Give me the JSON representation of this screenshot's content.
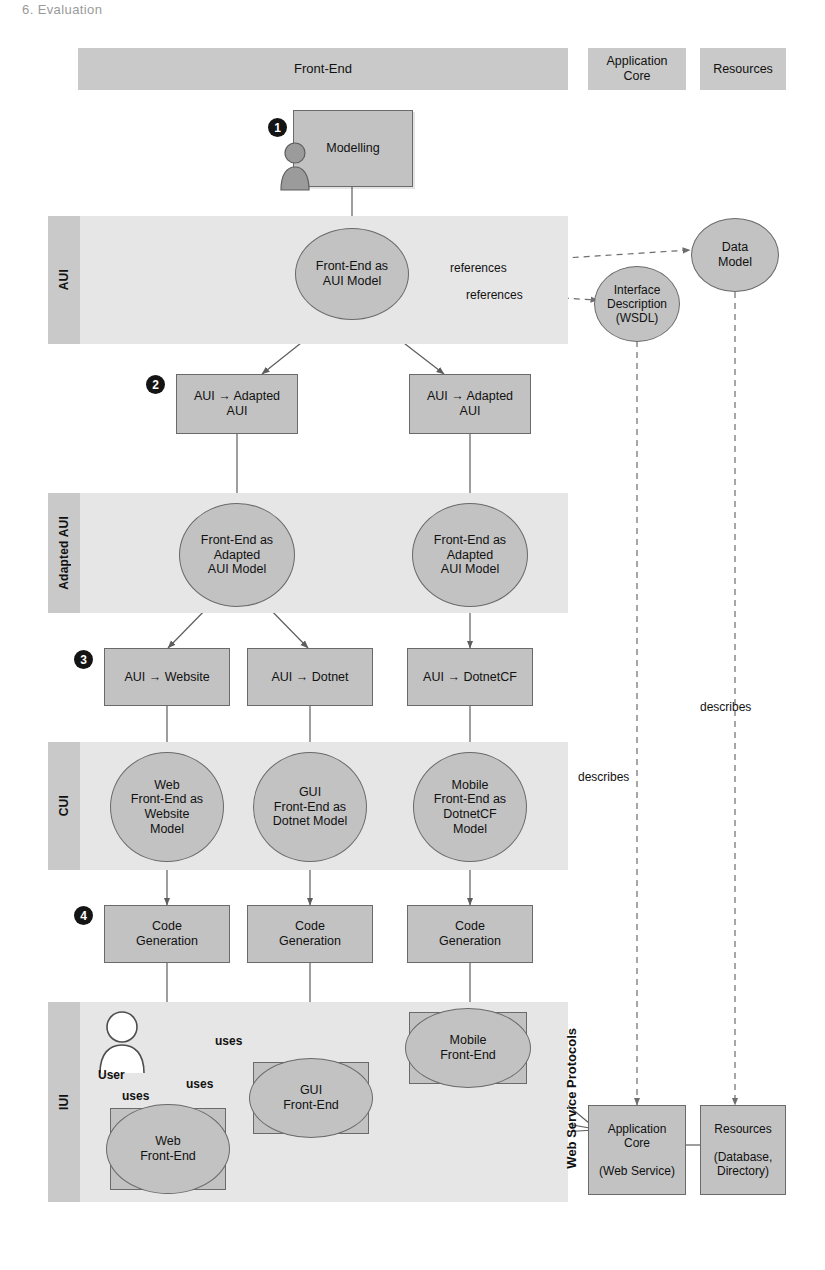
{
  "page": {
    "header_fragment": "6. Evaluation",
    "width": 825,
    "height": 1270,
    "colors": {
      "band_fill": "#e6e6e6",
      "band_label_fill": "#c9c9c9",
      "node_fill": "#c2c2c2",
      "node_stroke": "#6a6a6a",
      "badge_fill": "#141414",
      "text": "#111111"
    }
  },
  "column_headers": [
    {
      "label": "Front-End"
    },
    {
      "label": "Application\nCore"
    },
    {
      "label": "Resources"
    }
  ],
  "lanes": [
    {
      "label": "AUI"
    },
    {
      "label": "Adapted AUI"
    },
    {
      "label": "CUI"
    },
    {
      "label": "IUI"
    }
  ],
  "steps": [
    {
      "number": "1"
    },
    {
      "number": "2"
    },
    {
      "number": "3"
    },
    {
      "number": "4"
    }
  ],
  "nodes": {
    "modelling": "Modelling",
    "front_end_aui_model": "Front-End as\nAUI Model",
    "data_model": "Data\nModel",
    "interface_description": "Interface\nDescription\n(WSDL)",
    "aui_to_adapted_aui_left": "AUI → Adapted\nAUI",
    "aui_to_adapted_aui_right": "AUI → Adapted\nAUI",
    "front_end_adapted_aui_model_left": "Front-End as\nAdapted\nAUI Model",
    "front_end_adapted_aui_model_right": "Front-End as\nAdapted\nAUI Model",
    "aui_to_website": "AUI → Website",
    "aui_to_dotnet": "AUI → Dotnet",
    "aui_to_dotnetcf": "AUI → DotnetCF",
    "web_front_end_as_website_model": "Web\nFront-End as\nWebsite\nModel",
    "gui_front_end_as_dotnet_model": "GUI\nFront-End as\nDotnet Model",
    "mobile_front_end_as_dotnetcf_model": "Mobile\nFront-End as\nDotnetCF\nModel",
    "code_generation_1": "Code\nGeneration",
    "code_generation_2": "Code\nGeneration",
    "code_generation_3": "Code\nGeneration",
    "web_front_end": "Web\nFront-End",
    "gui_front_end": "GUI\nFront-End",
    "mobile_front_end": "Mobile\nFront-End",
    "application_core": "Application\nCore\n\n(Web Service)",
    "resources": "Resources\n\n(Database,\nDirectory)",
    "user_actor": "User"
  },
  "edge_labels": {
    "references_data_model": "references",
    "references_wsdl": "references",
    "describes_wsdl": "describes",
    "describes_data_model": "describes",
    "uses_mobile": "uses",
    "uses_gui": "uses",
    "uses_web": "uses",
    "web_service_protocols": "Web Service Protocols"
  }
}
